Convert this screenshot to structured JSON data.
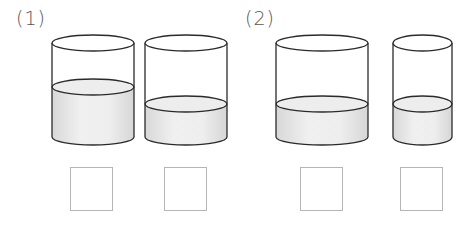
{
  "problems": [
    {
      "label": "(1)",
      "containers": [
        {
          "id": "a",
          "x": 52,
          "width": 82,
          "top_y": 43,
          "water_y": 87,
          "bottom_y": 137,
          "ellipse_ry": 8
        },
        {
          "id": "b",
          "x": 145,
          "width": 82,
          "top_y": 43,
          "water_y": 104,
          "bottom_y": 137,
          "ellipse_ry": 8
        }
      ],
      "answer_boxes": [
        {
          "x": 70,
          "y": 167,
          "value": ""
        },
        {
          "x": 164,
          "y": 167,
          "value": ""
        }
      ]
    },
    {
      "label": "(2)",
      "containers": [
        {
          "id": "c",
          "x": 276,
          "width": 92,
          "top_y": 43,
          "water_y": 104,
          "bottom_y": 137,
          "ellipse_ry": 8
        },
        {
          "id": "d",
          "x": 393,
          "width": 59,
          "top_y": 43,
          "water_y": 104,
          "bottom_y": 137,
          "ellipse_ry": 8
        }
      ],
      "answer_boxes": [
        {
          "x": 300,
          "y": 167,
          "value": ""
        },
        {
          "x": 400,
          "y": 167,
          "value": ""
        }
      ]
    }
  ],
  "colors": {
    "stroke": "#2a2a2a",
    "water": "#e6e6e6",
    "water_top": "#ededed",
    "box_border": "#b5b5b5",
    "label": "#555555"
  }
}
